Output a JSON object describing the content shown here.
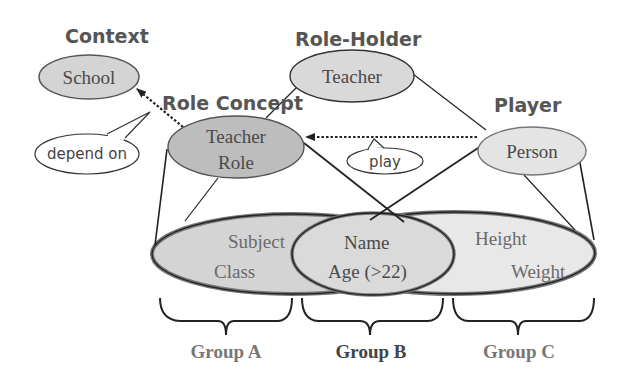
{
  "headings": {
    "context": "Context",
    "role_holder": "Role-Holder",
    "role_concept": "Role Concept",
    "player": "Player"
  },
  "nodes": {
    "school": "School",
    "teacher": "Teacher",
    "teacher_role_line1": "Teacher",
    "teacher_role_line2": "Role",
    "person": "Person"
  },
  "callouts": {
    "depend_on": "depend on",
    "play": "play"
  },
  "attributes": {
    "subject": "Subject",
    "class": "Class",
    "name": "Name",
    "age": "Age (>22)",
    "height": "Height",
    "weight": "Weight"
  },
  "groups": {
    "a": "Group A",
    "b": "Group B",
    "c": "Group C"
  },
  "colors": {
    "node_fill": "#d4d4d4",
    "role_fill": "#bdbdbd",
    "person_fill": "#e4e4e4",
    "left_set_fill": "#cfcfcf",
    "right_set_fill": "#e8e8e8",
    "stroke": "#333333"
  }
}
